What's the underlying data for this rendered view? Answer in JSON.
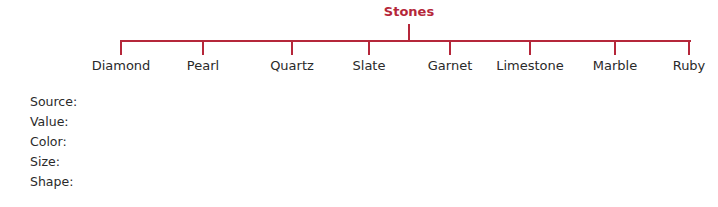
{
  "tree": {
    "root": {
      "label": "Stones"
    },
    "children": [
      {
        "label": "Diamond",
        "x": 121
      },
      {
        "label": "Pearl",
        "x": 203
      },
      {
        "label": "Quartz",
        "x": 292
      },
      {
        "label": "Slate",
        "x": 369
      },
      {
        "label": "Garnet",
        "x": 450
      },
      {
        "label": "Limestone",
        "x": 530
      },
      {
        "label": "Marble",
        "x": 615
      },
      {
        "label": "Ruby",
        "x": 689
      }
    ]
  },
  "properties": [
    {
      "label": "Source:"
    },
    {
      "label": "Value:"
    },
    {
      "label": "Color:"
    },
    {
      "label": "Size:"
    },
    {
      "label": "Shape:"
    }
  ],
  "colors": {
    "accent": "#b5273a",
    "text": "#2a2a2a"
  }
}
